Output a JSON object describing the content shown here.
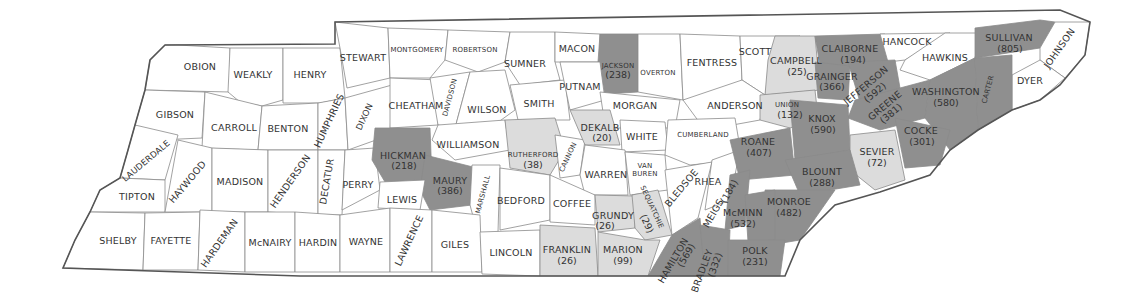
{
  "map": {
    "title": "Tennessee counties",
    "colors": {
      "none": "#ffffff",
      "low": "#dcdcdc",
      "high": "#8f8f8f",
      "border": "#555555"
    },
    "counties": [
      {
        "name": "OBION",
        "value": null,
        "shade": "none"
      },
      {
        "name": "WEAKLY",
        "value": null,
        "shade": "none"
      },
      {
        "name": "HENRY",
        "value": null,
        "shade": "none"
      },
      {
        "name": "STEWART",
        "value": null,
        "shade": "none"
      },
      {
        "name": "MONTGOMERY",
        "value": null,
        "shade": "none"
      },
      {
        "name": "ROBERTSON",
        "value": null,
        "shade": "none"
      },
      {
        "name": "SUMNER",
        "value": null,
        "shade": "none"
      },
      {
        "name": "MACON",
        "value": null,
        "shade": "none"
      },
      {
        "name": "JACKSON",
        "value": "(238)",
        "shade": "high"
      },
      {
        "name": "OVERTON",
        "value": null,
        "shade": "none"
      },
      {
        "name": "FENTRESS",
        "value": null,
        "shade": "none"
      },
      {
        "name": "SCOTT",
        "value": null,
        "shade": "none"
      },
      {
        "name": "CAMPBELL",
        "value": "(25)",
        "shade": "low"
      },
      {
        "name": "CLAIBORNE",
        "value": "(194)",
        "shade": "high"
      },
      {
        "name": "HANCOCK",
        "value": null,
        "shade": "none"
      },
      {
        "name": "HAWKINS",
        "value": null,
        "shade": "none"
      },
      {
        "name": "SULLIVAN",
        "value": "(805)",
        "shade": "high"
      },
      {
        "name": "JOHNSON",
        "value": null,
        "shade": "none"
      },
      {
        "name": "DYER",
        "value": null,
        "shade": "none"
      },
      {
        "name": "GIBSON",
        "value": null,
        "shade": "none"
      },
      {
        "name": "CARROLL",
        "value": null,
        "shade": "none"
      },
      {
        "name": "BENTON",
        "value": null,
        "shade": "none"
      },
      {
        "name": "HUMPHRIES",
        "value": null,
        "shade": "none"
      },
      {
        "name": "DIXON",
        "value": null,
        "shade": "none"
      },
      {
        "name": "CHEATHAM",
        "value": null,
        "shade": "none"
      },
      {
        "name": "DAVIDSON",
        "value": null,
        "shade": "none"
      },
      {
        "name": "WILSON",
        "value": null,
        "shade": "none"
      },
      {
        "name": "SMITH",
        "value": null,
        "shade": "none"
      },
      {
        "name": "PUTNAM",
        "value": null,
        "shade": "none"
      },
      {
        "name": "MORGAN",
        "value": null,
        "shade": "none"
      },
      {
        "name": "ANDERSON",
        "value": "(46)",
        "shade": "low"
      },
      {
        "name": "UNION",
        "value": "(132)",
        "shade": "high"
      },
      {
        "name": "GRAINGER",
        "value": "(366)",
        "shade": "high"
      },
      {
        "name": "JEFFERSON",
        "value": "(592)",
        "shade": "high"
      },
      {
        "name": "GREENE",
        "value": "(381)",
        "shade": "high"
      },
      {
        "name": "WASHINGTON",
        "value": "(580)",
        "shade": "high"
      },
      {
        "name": "CARTER",
        "value": null,
        "shade": "none"
      },
      {
        "name": "LAUDERDALE",
        "value": null,
        "shade": "none"
      },
      {
        "name": "TIPTON",
        "value": null,
        "shade": "none"
      },
      {
        "name": "HAYWOOD",
        "value": null,
        "shade": "none"
      },
      {
        "name": "MADISON",
        "value": null,
        "shade": "none"
      },
      {
        "name": "HENDERSON",
        "value": null,
        "shade": "none"
      },
      {
        "name": "DECATUR",
        "value": null,
        "shade": "none"
      },
      {
        "name": "PERRY",
        "value": null,
        "shade": "none"
      },
      {
        "name": "HICKMAN",
        "value": "(218)",
        "shade": "high"
      },
      {
        "name": "WILLIAMSON",
        "value": null,
        "shade": "none"
      },
      {
        "name": "MAURY",
        "value": "(386)",
        "shade": "high"
      },
      {
        "name": "LEWIS",
        "value": null,
        "shade": "none"
      },
      {
        "name": "MARSHALL",
        "value": null,
        "shade": "none"
      },
      {
        "name": "RUTHERFORD",
        "value": "(38)",
        "shade": "low"
      },
      {
        "name": "CANNON",
        "value": null,
        "shade": "none"
      },
      {
        "name": "DEKALB",
        "value": "(20)",
        "shade": "low"
      },
      {
        "name": "WHITE",
        "value": null,
        "shade": "none"
      },
      {
        "name": "CUMBERLAND",
        "value": null,
        "shade": "none"
      },
      {
        "name": "WARREN",
        "value": null,
        "shade": "none"
      },
      {
        "name": "VAN BUREN",
        "value": null,
        "shade": "none"
      },
      {
        "name": "BEDFORD",
        "value": null,
        "shade": "none"
      },
      {
        "name": "COFFEE",
        "value": null,
        "shade": "none"
      },
      {
        "name": "GRUNDY",
        "value": "(26)",
        "shade": "low"
      },
      {
        "name": "SEQUATCHIE",
        "value": "(29)",
        "shade": "low"
      },
      {
        "name": "BLEDSOE",
        "value": null,
        "shade": "none"
      },
      {
        "name": "RHEA",
        "value": null,
        "shade": "none"
      },
      {
        "name": "ROANE",
        "value": "(407)",
        "shade": "high"
      },
      {
        "name": "KNOX",
        "value": "(590)",
        "shade": "high"
      },
      {
        "name": "SEVIER",
        "value": "(72)",
        "shade": "low"
      },
      {
        "name": "COCKE",
        "value": "(301)",
        "shade": "high"
      },
      {
        "name": "BLOUNT",
        "value": "(288)",
        "shade": "high"
      },
      {
        "name": "MEIGS",
        "value": "(184)",
        "shade": "high"
      },
      {
        "name": "MONROE",
        "value": "(482)",
        "shade": "high"
      },
      {
        "name": "McMINN",
        "value": "(532)",
        "shade": "high"
      },
      {
        "name": "SHELBY",
        "value": null,
        "shade": "none"
      },
      {
        "name": "FAYETTE",
        "value": null,
        "shade": "none"
      },
      {
        "name": "HARDEMAN",
        "value": null,
        "shade": "none"
      },
      {
        "name": "McNAIRY",
        "value": null,
        "shade": "none"
      },
      {
        "name": "HARDIN",
        "value": null,
        "shade": "none"
      },
      {
        "name": "WAYNE",
        "value": null,
        "shade": "none"
      },
      {
        "name": "LAWRENCE",
        "value": null,
        "shade": "none"
      },
      {
        "name": "GILES",
        "value": null,
        "shade": "none"
      },
      {
        "name": "LINCOLN",
        "value": null,
        "shade": "none"
      },
      {
        "name": "FRANKLIN",
        "value": "(26)",
        "shade": "low"
      },
      {
        "name": "MARION",
        "value": "(99)",
        "shade": "low"
      },
      {
        "name": "HAMILTON",
        "value": "(569)",
        "shade": "high"
      },
      {
        "name": "BRADLEY",
        "value": "(332)",
        "shade": "high"
      },
      {
        "name": "POLK",
        "value": "(231)",
        "shade": "high"
      }
    ]
  }
}
